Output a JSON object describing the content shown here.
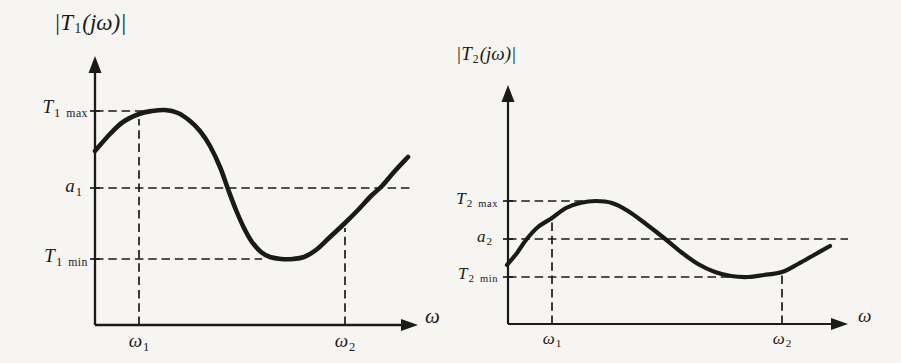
{
  "figure": {
    "background": "#f6f5f1",
    "ink": "#1a1a1a"
  },
  "plots": [
    {
      "id": "left",
      "title": {
        "pre": "|T",
        "sub": "1",
        "post": "(jω)|"
      },
      "axis_label_x": "ω",
      "y_labels": [
        {
          "main": "T",
          "sub": "1",
          "small": "max"
        },
        {
          "main": "a",
          "sub": "1",
          "small": ""
        },
        {
          "main": "T",
          "sub": "1",
          "small": "min"
        }
      ],
      "x_labels": [
        {
          "main": "ω",
          "sub": "1"
        },
        {
          "main": "ω",
          "sub": "2"
        }
      ],
      "geometry": {
        "origin": [
          95,
          325
        ],
        "y_top": 56,
        "x_end": 418,
        "axis_width": 2.3,
        "curve_width": 4.6,
        "y_ticks": [
          111,
          188,
          259
        ],
        "dashed": [
          [
            95,
            111,
            160,
            111
          ],
          [
            95,
            188,
            411,
            188
          ],
          [
            95,
            259,
            262,
            259
          ],
          [
            139,
            325,
            139,
            119
          ],
          [
            345,
            325,
            345,
            228
          ]
        ],
        "curve": [
          [
            95,
            151
          ],
          [
            110,
            134
          ],
          [
            123,
            122
          ],
          [
            139,
            114
          ],
          [
            152,
            111
          ],
          [
            165,
            110
          ],
          [
            178,
            113
          ],
          [
            190,
            121
          ],
          [
            200,
            131
          ],
          [
            210,
            146
          ],
          [
            220,
            167
          ],
          [
            228,
            189
          ],
          [
            236,
            210
          ],
          [
            244,
            228
          ],
          [
            252,
            242
          ],
          [
            261,
            252
          ],
          [
            270,
            257
          ],
          [
            281,
            259
          ],
          [
            293,
            259
          ],
          [
            304,
            257
          ],
          [
            316,
            250
          ],
          [
            329,
            238
          ],
          [
            345,
            223
          ],
          [
            358,
            210
          ],
          [
            371,
            196
          ],
          [
            382,
            186
          ],
          [
            394,
            172
          ],
          [
            408,
            157
          ]
        ]
      }
    },
    {
      "id": "right",
      "title": {
        "pre": "|T",
        "sub": "2",
        "post": "(jω)|"
      },
      "axis_label_x": "ω",
      "y_labels": [
        {
          "main": "T",
          "sub": "2",
          "small": "max"
        },
        {
          "main": "a",
          "sub": "2",
          "small": ""
        },
        {
          "main": "T",
          "sub": "2",
          "small": "min"
        }
      ],
      "x_labels": [
        {
          "main": "ω",
          "sub": "1"
        },
        {
          "main": "ω",
          "sub": "2"
        }
      ],
      "geometry": {
        "origin": [
          508,
          324
        ],
        "y_top": 85,
        "x_end": 848,
        "axis_width": 2.2,
        "curve_width": 4.2,
        "y_ticks": [
          201,
          239,
          277
        ],
        "dashed": [
          [
            508,
            201,
            583,
            201
          ],
          [
            508,
            239,
            848,
            239
          ],
          [
            508,
            277,
            733,
            277
          ],
          [
            552,
            324,
            552,
            222
          ],
          [
            782,
            324,
            782,
            275
          ]
        ],
        "curve": [
          [
            507,
            265
          ],
          [
            517,
            253
          ],
          [
            526,
            240
          ],
          [
            538,
            227
          ],
          [
            552,
            218
          ],
          [
            566,
            208
          ],
          [
            580,
            203
          ],
          [
            596,
            201
          ],
          [
            612,
            203
          ],
          [
            628,
            211
          ],
          [
            646,
            224
          ],
          [
            664,
            238
          ],
          [
            681,
            252
          ],
          [
            698,
            264
          ],
          [
            715,
            272
          ],
          [
            731,
            276
          ],
          [
            748,
            277
          ],
          [
            764,
            275
          ],
          [
            782,
            272
          ],
          [
            798,
            264
          ],
          [
            814,
            255
          ],
          [
            830,
            246
          ]
        ]
      }
    }
  ],
  "chart_data": [
    {
      "type": "line",
      "title": "|T₁(jω)| versus ω",
      "xlabel": "ω",
      "ylabel": "|T₁(jω)|",
      "x_ticks": [
        "ω₁",
        "ω₂"
      ],
      "x_tick_positions_norm": {
        "ω₁": 0.14,
        "ω₂": 0.8
      },
      "y_reference_levels_norm": {
        "T1 max": 1.0,
        "a1": 0.48,
        "T1 min": 0.0
      },
      "points_norm": [
        [
          0.0,
          0.73
        ],
        [
          0.07,
          0.86
        ],
        [
          0.14,
          0.98
        ],
        [
          0.22,
          1.0
        ],
        [
          0.3,
          0.87
        ],
        [
          0.37,
          0.67
        ],
        [
          0.42,
          0.47
        ],
        [
          0.48,
          0.22
        ],
        [
          0.55,
          0.03
        ],
        [
          0.61,
          0.0
        ],
        [
          0.67,
          0.02
        ],
        [
          0.73,
          0.12
        ],
        [
          0.8,
          0.24
        ],
        [
          0.86,
          0.37
        ],
        [
          0.92,
          0.49
        ],
        [
          1.0,
          0.69
        ]
      ],
      "grid": false,
      "legend": false,
      "annotations": [
        "dashed horizontal at T1 max touches the curve maximum just after ω₁",
        "dashed horizontal at a1 spans the plot and intersects the curve twice",
        "dashed horizontal at T1 min touches the flat curve minimum",
        "dashed verticals rise from ω₁ and ω₂ to the curve"
      ]
    },
    {
      "type": "line",
      "title": "|T₂(jω)| versus ω",
      "xlabel": "ω",
      "ylabel": "|T₂(jω)|",
      "x_ticks": [
        "ω₁",
        "ω₂"
      ],
      "x_tick_positions_norm": {
        "ω₁": 0.14,
        "ω₂": 0.85
      },
      "y_reference_levels_norm": {
        "T2 max": 1.0,
        "a2": 0.5,
        "T2 min": 0.0
      },
      "points_norm": [
        [
          0.0,
          0.16
        ],
        [
          0.06,
          0.49
        ],
        [
          0.14,
          0.78
        ],
        [
          0.21,
          0.95
        ],
        [
          0.27,
          1.0
        ],
        [
          0.34,
          0.92
        ],
        [
          0.42,
          0.7
        ],
        [
          0.48,
          0.51
        ],
        [
          0.56,
          0.3
        ],
        [
          0.64,
          0.1
        ],
        [
          0.72,
          0.01
        ],
        [
          0.75,
          0.0
        ],
        [
          0.8,
          0.03
        ],
        [
          0.85,
          0.07
        ],
        [
          0.93,
          0.25
        ],
        [
          1.0,
          0.41
        ]
      ],
      "grid": false,
      "legend": false,
      "annotations": [
        "dashed horizontal at T2 max touches the curve maximum just after ω₁",
        "dashed horizontal at a2 spans the plot and intersects the curve twice",
        "dashed horizontal at T2 min touches the flat curve minimum near ω₂",
        "dashed verticals rise from ω₁ and ω₂ to the curve"
      ]
    }
  ]
}
